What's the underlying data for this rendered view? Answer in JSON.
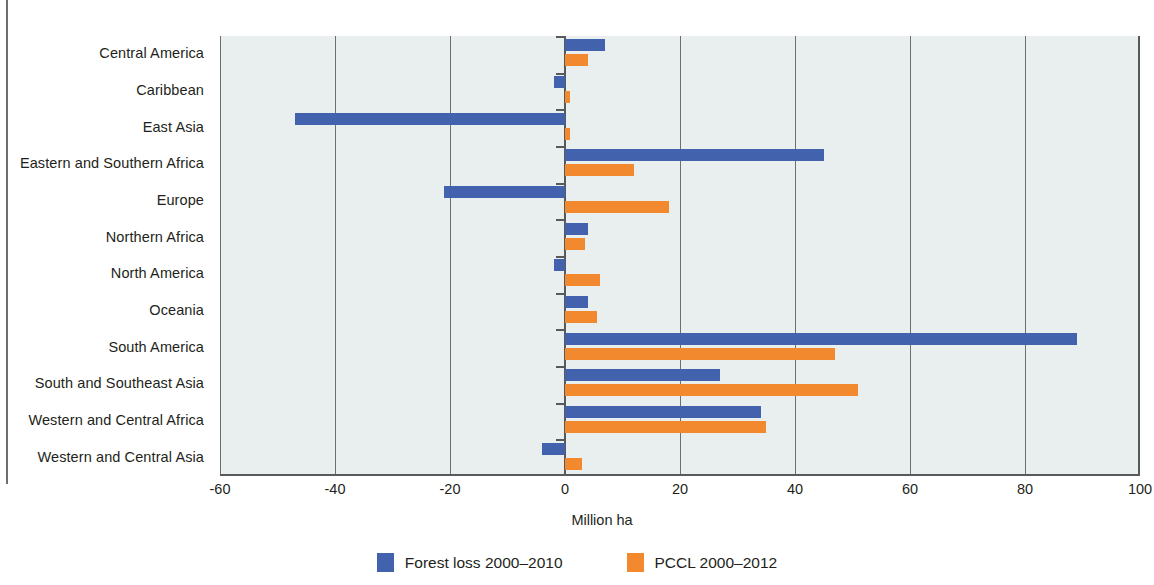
{
  "chart_data": {
    "type": "bar",
    "orientation": "horizontal",
    "title": "",
    "xlabel": "Million ha",
    "ylabel": "",
    "xlim": [
      -60,
      100
    ],
    "xticks": [
      -60,
      -40,
      -20,
      0,
      20,
      40,
      60,
      80,
      100
    ],
    "xtick_labels": [
      "-60",
      "-40",
      "-20",
      "0",
      "20",
      "40",
      "60",
      "80",
      "100"
    ],
    "grid": true,
    "legend_position": "bottom",
    "categories": [
      "Central America",
      "Caribbean",
      "East Asia",
      "Eastern and Southern Africa",
      "Europe",
      "Northern Africa",
      "North America",
      "Oceania",
      "South America",
      "South and Southeast Asia",
      "Western and Central Africa",
      "Western and Central Asia"
    ],
    "series": [
      {
        "name": "Forest loss 2000-2010",
        "color": "#4262ad",
        "values": [
          7,
          -2,
          -47,
          45,
          -21,
          4,
          -2,
          4,
          89,
          27,
          34,
          -4
        ]
      },
      {
        "name": "PCCL 2000-2012",
        "color": "#f3892e",
        "values": [
          4,
          0.8,
          0.8,
          12,
          18,
          3.5,
          6,
          5.5,
          47,
          51,
          35,
          3
        ]
      }
    ]
  },
  "legend": {
    "items": [
      {
        "label": "Forest loss 2000–2010",
        "color": "#4262ad"
      },
      {
        "label": "PCCL 2000–2012",
        "color": "#f3892e"
      }
    ]
  },
  "axis": {
    "x_title": "Million ha"
  }
}
